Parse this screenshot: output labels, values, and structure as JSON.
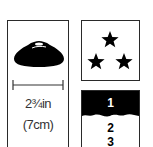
{
  "size_panel": {
    "icon": "cone-icon",
    "measure_icon": "dimension-line-icon",
    "imperial": "2¾in",
    "metric": "(7cm)"
  },
  "rating_panel": {
    "icon": "three-stars-icon",
    "stars": 3
  },
  "level_panel": {
    "levels": [
      "1",
      "2",
      "3"
    ],
    "selected": "1",
    "colors": {
      "selected_bg": "#000000",
      "selected_fg": "#ffffff",
      "text": "#000000"
    }
  }
}
